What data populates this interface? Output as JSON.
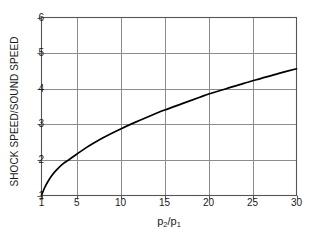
{
  "chart_data": {
    "type": "line",
    "title": "",
    "xlabel": "p2/p1",
    "xlabel_parts": {
      "base1": "p",
      "sub1": "2",
      "slash": "/",
      "base2": "p",
      "sub2": "1"
    },
    "ylabel": "SHOCK SPEED/SOUND SPEED",
    "xlim": [
      1,
      30
    ],
    "ylim": [
      1,
      6
    ],
    "xticks": [
      1,
      5,
      10,
      15,
      20,
      25,
      30
    ],
    "xtick_labels": [
      "1",
      "5",
      "10",
      "15",
      "20",
      "25",
      "30"
    ],
    "yticks": [
      1,
      2,
      3,
      4,
      5,
      6
    ],
    "ytick_labels": [
      "1",
      "2",
      "3",
      "4",
      "5",
      "6"
    ],
    "grid": true,
    "grid_x_values": [
      5,
      10,
      15,
      20,
      25
    ],
    "grid_y_values": [
      2,
      3,
      4,
      5
    ],
    "legend": null,
    "series": [
      {
        "name": "shock speed ratio",
        "x": [
          1,
          1.3,
          1.7,
          2.2,
          2.8,
          3.5,
          4.2,
          5,
          6,
          7,
          8,
          9,
          10,
          11.5,
          13,
          15,
          17,
          19,
          20,
          22,
          24,
          26,
          28,
          30
        ],
        "values": [
          1.0,
          1.19,
          1.38,
          1.57,
          1.74,
          1.9,
          2.02,
          2.16,
          2.33,
          2.48,
          2.62,
          2.75,
          2.87,
          3.04,
          3.2,
          3.4,
          3.58,
          3.76,
          3.85,
          4.0,
          4.15,
          4.29,
          4.43,
          4.56
        ]
      }
    ],
    "colors": {
      "curve": "#000000",
      "grid": "#8c8c8c",
      "axis": "#555555",
      "background": "#ffffff",
      "text": "#1a1a1a"
    }
  }
}
